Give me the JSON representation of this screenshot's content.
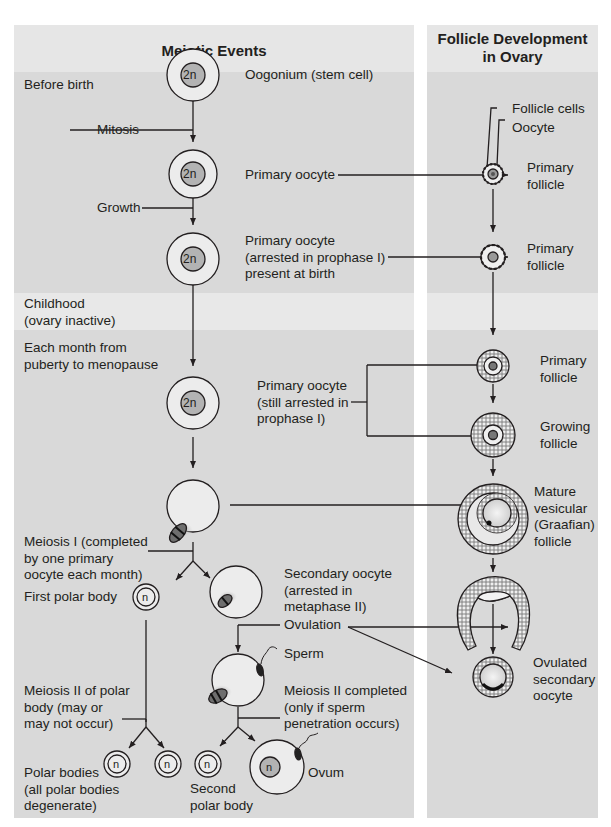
{
  "title_fragments": [
    ".",
    "."
  ],
  "columns": {
    "left_title": "Meiotic Events",
    "right_title": "Follicle Development\nin Ovary"
  },
  "stages": {
    "before_birth": "Before birth",
    "childhood": "Childhood\n(ovary inactive)",
    "monthly": "Each month from\npuberty to menopause"
  },
  "processes": {
    "mitosis": "Mitosis",
    "growth": "Growth",
    "meiosis_1": "Meiosis I (completed\nby one primary\noocyte each month)",
    "ovulation": "Ovulation",
    "sperm": "Sperm",
    "meiosis_2_polar": "Meiosis II of polar\nbody (may or\nmay not occur)",
    "meiosis_2_completed": "Meiosis II completed\n(only if sperm\npenetration occurs)"
  },
  "cells": {
    "oogonium": "Oogonium (stem cell)",
    "primary_oocyte": "Primary oocyte",
    "primary_oocyte_arrested": "Primary oocyte\n(arrested in prophase I)\npresent at birth",
    "primary_oocyte_still": "Primary oocyte\n(still arrested in\nprophase I)",
    "secondary_oocyte": "Secondary oocyte\n(arrested in\nmetaphase II)",
    "first_polar_body": "First polar body",
    "polar_bodies": "Polar bodies\n(all polar bodies\ndegenerate)",
    "second_polar_body": "Second\npolar body",
    "ovum": "Ovum",
    "ploidy_diploid": "2n",
    "ploidy_haploid": "n"
  },
  "follicles": {
    "follicle_cells": "Follicle cells",
    "oocyte": "Oocyte",
    "primary_follicle_1": "Primary\nfollicle",
    "primary_follicle_2": "Primary\nfollicle",
    "primary_follicle_3": "Primary\nfollicle",
    "growing_follicle": "Growing\nfollicle",
    "mature_follicle": "Mature\nvesicular\n(Graafian)\nfollicle",
    "ovulated_oocyte": "Ovulated\nsecondary\noocyte"
  },
  "colors": {
    "header_band": "#e6e6e6",
    "panel_bg": "#d9d9d9",
    "childhood_band": "#e8e8e8",
    "nucleus": "#b3b3b3",
    "line": "#231f20"
  }
}
